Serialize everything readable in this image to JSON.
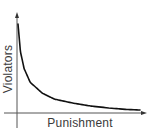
{
  "chart_data": {
    "type": "line",
    "title": "",
    "xlabel": "Punishment",
    "ylabel": "Violators",
    "grid": false,
    "legend": null,
    "axis_ticks": false,
    "series": [
      {
        "name": "Violators vs Punishment",
        "x": [
          0.0,
          0.02,
          0.05,
          0.1,
          0.2,
          0.3,
          0.45,
          0.6,
          0.75,
          0.9,
          1.0
        ],
        "values": [
          0.9,
          0.62,
          0.45,
          0.31,
          0.2,
          0.14,
          0.1,
          0.07,
          0.05,
          0.035,
          0.03
        ]
      }
    ],
    "xlim": [
      0,
      1.05
    ],
    "ylim": [
      -0.15,
      1.0
    ]
  },
  "labels": {
    "x_axis": "Punishment",
    "y_axis": "Violators"
  },
  "colors": {
    "axis": "#555555",
    "curve": "#111111",
    "text": "#3a3a3a",
    "background": "#ffffff"
  }
}
